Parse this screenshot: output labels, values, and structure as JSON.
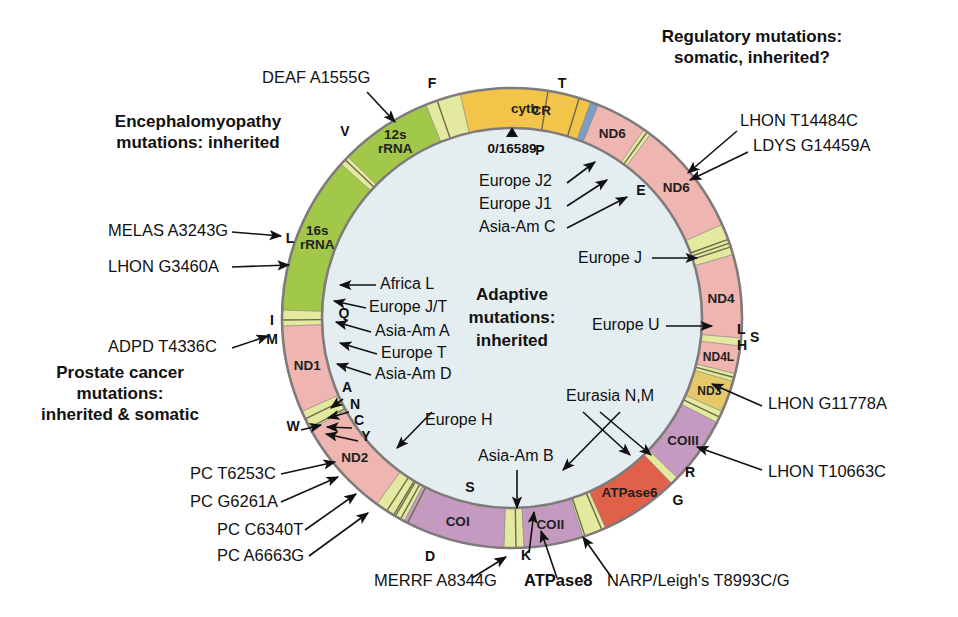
{
  "figure": {
    "center_label_lines": [
      "Adaptive",
      "mutations:",
      "inherited"
    ],
    "origin_label": "0/16589",
    "colors": {
      "control_region": "#7e9cc4",
      "rrna": "#a2c84a",
      "trna": "#e4e9a0",
      "nd_complex1": "#efb5b0",
      "cytb": "#f2c44a",
      "co_complex4": "#c49ac0",
      "atpase": "#e1604a",
      "ring_outline": "#807b7b",
      "interior": "#e4eef0"
    },
    "geometry": {
      "cx": 512,
      "cy": 318,
      "outer_r": 230,
      "inner_r": 190
    }
  },
  "headings": [
    {
      "id": "encephalomyopathy",
      "lines": [
        "Encephalomyopathy",
        "mutations: inherited"
      ],
      "x": 198,
      "y": 127
    },
    {
      "id": "regulatory",
      "lines": [
        "Regulatory mutations:",
        "somatic, inherited?"
      ],
      "x": 752,
      "y": 42
    },
    {
      "id": "prostate",
      "lines": [
        "Prostate cancer",
        "mutations:",
        "inherited & somatic"
      ],
      "x": 120,
      "y": 378
    }
  ],
  "center_text": {
    "lines": [
      "Adaptive",
      "mutations:",
      "inherited"
    ],
    "x": 512,
    "y": 300
  },
  "genes": [
    {
      "name": "CR",
      "start": 352.0,
      "end": 24.0,
      "color": "#7e9cc4",
      "label_r": 210,
      "cls": "gene"
    },
    {
      "name": "12s rRNA",
      "start": 314.5,
      "end": 338.0,
      "color": "#a2c84a",
      "label_r": 210,
      "cls": "gene",
      "two_line": true
    },
    {
      "name": "16s rRNA",
      "start": 272.0,
      "end": 312.0,
      "color": "#a2c84a",
      "label_r": 210,
      "cls": "gene",
      "two_line": true
    },
    {
      "name": "ND1",
      "start": 246.0,
      "end": 268.0,
      "color": "#efb5b0",
      "label_r": 210,
      "cls": "gene"
    },
    {
      "name": "ND2",
      "start": 216.0,
      "end": 241.0,
      "color": "#efb5b0",
      "label_r": 210,
      "cls": "gene"
    },
    {
      "name": "COI",
      "start": 182.0,
      "end": 208.0,
      "color": "#c49ac0",
      "label_r": 210,
      "cls": "gene"
    },
    {
      "name": "COII",
      "start": 162.0,
      "end": 177.0,
      "color": "#c49ac0",
      "label_r": 210,
      "cls": "gene"
    },
    {
      "name": "ATPase6",
      "start": 136.0,
      "end": 156.0,
      "color": "#e1604a",
      "label_r": 210,
      "cls": "gene"
    },
    {
      "name": "COIII",
      "start": 117.0,
      "end": 134.0,
      "color": "#c49ac0",
      "label_r": 210,
      "cls": "gene"
    },
    {
      "name": "ND3",
      "start": 106.0,
      "end": 114.0,
      "color": "#e4c86a",
      "label_r": 210,
      "cls": "gene-sm"
    },
    {
      "name": "ND4L",
      "start": 97.0,
      "end": 104.0,
      "color": "#efb5b0",
      "label_r": 210,
      "cls": "gene-sm"
    },
    {
      "name": "ND4",
      "start": 74.0,
      "end": 95.0,
      "color": "#efb5b0",
      "label_r": 210,
      "cls": "gene"
    },
    {
      "name": "ND6",
      "start": 37.0,
      "end": 66.0,
      "color": "#efb5b0",
      "label_r": 210,
      "cls": "gene"
    },
    {
      "name": "ND6",
      "start": 22.0,
      "end": 35.0,
      "color": "#efb5b0",
      "label_r": 210,
      "cls": "gene"
    },
    {
      "name": "cytb",
      "start": 347.0,
      "end": 20.0,
      "color": "#f2c44a",
      "label_r": 210,
      "cls": "gene",
      "sector": "right"
    }
  ],
  "trna_marks": [
    {
      "name": "F",
      "angle": 341.0,
      "label_r": 255
    },
    {
      "name": "V",
      "angle": 313.5,
      "label_r": 255
    },
    {
      "name": "L",
      "angle": 269.5,
      "label_r": 252
    },
    {
      "name": "I",
      "angle": 244.0,
      "label_r": 256
    },
    {
      "name": "M",
      "angle": 241.5,
      "label_r": 256
    },
    {
      "name": "W",
      "angle": 210.5,
      "label_r": 256
    },
    {
      "name": "A",
      "angle": 213.0,
      "label_r": 250
    },
    {
      "name": "N",
      "angle": 211.0,
      "label_r": 250
    },
    {
      "name": "C",
      "angle": 209.0,
      "label_r": 250
    },
    {
      "name": "Y",
      "angle": 207.0,
      "label_r": 250
    },
    {
      "name": "S",
      "angle": 179.0,
      "label_r": 255
    },
    {
      "name": "D",
      "angle": 161.5,
      "label_r": 255
    },
    {
      "name": "K",
      "angle": 157.0,
      "label_r": 255
    },
    {
      "name": "G",
      "angle": 115.5,
      "label_r": 255
    },
    {
      "name": "R",
      "angle": 105.0,
      "label_r": 255
    },
    {
      "name": "L",
      "angle": 72.0,
      "label_r": 254
    },
    {
      "name": "H",
      "angle": 70.0,
      "label_r": 254
    },
    {
      "name": "S",
      "angle": 71.0,
      "label_r": 254
    },
    {
      "name": "E",
      "angle": 36.0,
      "label_r": 254
    },
    {
      "name": "T",
      "angle": 17.0,
      "label_r": 255
    },
    {
      "name": "P",
      "angle": 9.0,
      "label_r": 255
    }
  ],
  "trna_visible_labels": [
    {
      "name": "F",
      "x": 432,
      "y": 88,
      "anchor": "middle"
    },
    {
      "name": "T",
      "x": 562,
      "y": 88,
      "anchor": "middle"
    },
    {
      "name": "V",
      "x": 345,
      "y": 136,
      "anchor": "middle"
    },
    {
      "name": "P",
      "x": 540,
      "y": 155,
      "anchor": "middle"
    },
    {
      "name": "E",
      "x": 641,
      "y": 195,
      "anchor": "middle"
    },
    {
      "name": "L",
      "x": 290,
      "y": 243,
      "anchor": "middle"
    },
    {
      "name": "Q",
      "x": 344,
      "y": 318,
      "anchor": "middle"
    },
    {
      "name": "I",
      "x": 272,
      "y": 325,
      "anchor": "middle"
    },
    {
      "name": "M",
      "x": 272,
      "y": 344,
      "anchor": "middle"
    },
    {
      "name": "L",
      "x": 737,
      "y": 334,
      "anchor": "start"
    },
    {
      "name": "S",
      "x": 750,
      "y": 342,
      "anchor": "start"
    },
    {
      "name": "H",
      "x": 737,
      "y": 350,
      "anchor": "start"
    },
    {
      "name": "A",
      "x": 347,
      "y": 392,
      "anchor": "middle"
    },
    {
      "name": "N",
      "x": 355,
      "y": 409,
      "anchor": "middle"
    },
    {
      "name": "C",
      "x": 359,
      "y": 425,
      "anchor": "middle"
    },
    {
      "name": "Y",
      "x": 366,
      "y": 441,
      "anchor": "middle"
    },
    {
      "name": "W",
      "x": 293,
      "y": 431,
      "anchor": "middle"
    },
    {
      "name": "R",
      "x": 690,
      "y": 477,
      "anchor": "middle"
    },
    {
      "name": "G",
      "x": 678,
      "y": 505,
      "anchor": "middle"
    },
    {
      "name": "S",
      "x": 470,
      "y": 492,
      "anchor": "middle"
    },
    {
      "name": "D",
      "x": 430,
      "y": 561,
      "anchor": "middle"
    },
    {
      "name": "K",
      "x": 526,
      "y": 560,
      "anchor": "middle"
    }
  ],
  "disease_annotations": [
    {
      "id": "deaf",
      "text": "DEAF A1555G",
      "x": 262,
      "y": 83,
      "anchor": "start"
    },
    {
      "id": "lhon-t14484c",
      "text": "LHON T14484C",
      "x": 740,
      "y": 126,
      "anchor": "start"
    },
    {
      "id": "ldys",
      "text": "LDYS G14459A",
      "x": 753,
      "y": 151,
      "anchor": "start"
    },
    {
      "id": "melas",
      "text": "MELAS A3243G",
      "x": 108,
      "y": 236,
      "anchor": "start"
    },
    {
      "id": "lhon-g3460a",
      "text": "LHON G3460A",
      "x": 108,
      "y": 272,
      "anchor": "start"
    },
    {
      "id": "adpd",
      "text": "ADPD T4336C",
      "x": 108,
      "y": 352,
      "anchor": "start"
    },
    {
      "id": "lhon-g11778a",
      "text": "LHON G11778A",
      "x": 768,
      "y": 409,
      "anchor": "start"
    },
    {
      "id": "lhon-t10663c",
      "text": "LHON T10663C",
      "x": 768,
      "y": 477,
      "anchor": "start"
    },
    {
      "id": "pc-t6253c",
      "text": "PC T6253C",
      "x": 190,
      "y": 479,
      "anchor": "start"
    },
    {
      "id": "pc-g6261a",
      "text": "PC G6261A",
      "x": 190,
      "y": 507,
      "anchor": "start"
    },
    {
      "id": "pc-c6340t",
      "text": "PC C6340T",
      "x": 217,
      "y": 535,
      "anchor": "start"
    },
    {
      "id": "pc-a6663g",
      "text": "PC A6663G",
      "x": 217,
      "y": 561,
      "anchor": "start"
    },
    {
      "id": "merrf",
      "text": "MERRF A8344G",
      "x": 374,
      "y": 586,
      "anchor": "start"
    },
    {
      "id": "atpase8",
      "text": "ATPase8",
      "x": 524,
      "y": 586,
      "anchor": "start",
      "bold": true
    },
    {
      "id": "narp",
      "text": "NARP/Leigh's T8993C/G",
      "x": 607,
      "y": 586,
      "anchor": "start"
    }
  ],
  "haplogroup_annotations": [
    {
      "id": "europe-j2",
      "text": "Europe J2",
      "x": 479,
      "y": 186,
      "anchor": "start"
    },
    {
      "id": "europe-j1",
      "text": "Europe J1",
      "x": 479,
      "y": 209,
      "anchor": "start"
    },
    {
      "id": "asia-am-c",
      "text": "Asia-Am C",
      "x": 479,
      "y": 232,
      "anchor": "start"
    },
    {
      "id": "europe-j",
      "text": "Europe J",
      "x": 578,
      "y": 263,
      "anchor": "start"
    },
    {
      "id": "europe-u",
      "text": "Europe U",
      "x": 592,
      "y": 330,
      "anchor": "start"
    },
    {
      "id": "africa-l",
      "text": "Africa L",
      "x": 380,
      "y": 289,
      "anchor": "start"
    },
    {
      "id": "europe-jt",
      "text": "Europe J/T",
      "x": 369,
      "y": 312,
      "anchor": "start"
    },
    {
      "id": "asia-am-a",
      "text": "Asia-Am A",
      "x": 375,
      "y": 336,
      "anchor": "start"
    },
    {
      "id": "europe-t",
      "text": "Europe T",
      "x": 381,
      "y": 358,
      "anchor": "start"
    },
    {
      "id": "asia-am-d",
      "text": "Asia-Am D",
      "x": 375,
      "y": 379,
      "anchor": "start"
    },
    {
      "id": "europe-h",
      "text": "Europe H",
      "x": 425,
      "y": 425,
      "anchor": "start"
    },
    {
      "id": "asia-am-b",
      "text": "Asia-Am B",
      "x": 478,
      "y": 461,
      "anchor": "start"
    },
    {
      "id": "eurasia-nm",
      "text": "Eurasia N,M",
      "x": 566,
      "y": 401,
      "anchor": "start"
    }
  ],
  "leader_lines": [
    {
      "id": "deaf-lead",
      "d": "M 367 92 L 395 122"
    },
    {
      "id": "lhon-t14484c-lead",
      "d": "M 737 131 L 688 173"
    },
    {
      "id": "ldys-lead",
      "d": "M 748 152 L 690 180"
    },
    {
      "id": "melas-lead",
      "d": "M 232 232 L 281 236"
    },
    {
      "id": "lhon-g3460a-lead",
      "d": "M 232 267 L 289 265"
    },
    {
      "id": "adpd-lead",
      "d": "M 232 348 L 268 336"
    },
    {
      "id": "lhon-g11778a-lead",
      "d": "M 762 406 L 712 384"
    },
    {
      "id": "lhon-t10663c-lead",
      "d": "M 762 470 L 697 447"
    },
    {
      "id": "pc-t6253c-lead",
      "d": "M 281 474 L 335 462"
    },
    {
      "id": "pc-g6261a-lead",
      "d": "M 281 502 L 338 477"
    },
    {
      "id": "pc-c6340t-lead",
      "d": "M 305 530 L 356 494"
    },
    {
      "id": "pc-a6663g-lead",
      "d": "M 309 556 L 368 513"
    },
    {
      "id": "merrf-lead",
      "d": "M 472 578 L 506 557"
    },
    {
      "id": "atpase8-lead",
      "d": "M 557 578 L 541 531"
    },
    {
      "id": "narp-lead",
      "d": "M 612 578 L 583 537"
    },
    {
      "id": "europe-j2-lead",
      "d": "M 567 183 L 595 162"
    },
    {
      "id": "europe-j1-lead",
      "d": "M 567 206 L 607 180"
    },
    {
      "id": "asia-am-c-lead",
      "d": "M 567 228 L 627 197"
    },
    {
      "id": "europe-j-lead",
      "d": "M 652 258 L 697 258"
    },
    {
      "id": "europe-u-lead",
      "d": "M 666 326 L 712 326"
    },
    {
      "id": "africa-l-lead",
      "d": "M 376 285 L 340 285"
    },
    {
      "id": "europe-jt-lead",
      "d": "M 366 308 L 334 301"
    },
    {
      "id": "asia-am-a-lead",
      "d": "M 371 332 L 336 322"
    },
    {
      "id": "europe-t-lead",
      "d": "M 377 354 L 340 343"
    },
    {
      "id": "asia-am-d-lead",
      "d": "M 371 375 L 337 364"
    },
    {
      "id": "europe-h-lead",
      "d": "M 432 412 L 397 448"
    },
    {
      "id": "asia-am-b-lead",
      "d": "M 517 470 L 517 508"
    },
    {
      "id": "eurasia-nm-1",
      "d": "M 600 412 L 651 455"
    },
    {
      "id": "eurasia-nm-2",
      "d": "M 583 412 L 630 455"
    },
    {
      "id": "eurasia-nm-3",
      "d": "M 620 412 L 563 470"
    },
    {
      "id": "trna-a-lead",
      "d": "M 343 399 L 331 408"
    },
    {
      "id": "trna-n-lead",
      "d": "M 349 412 L 328 418"
    },
    {
      "id": "trna-c-lead",
      "d": "M 352 428 L 327 427"
    },
    {
      "id": "trna-y-lead",
      "d": "M 358 441 L 326 434"
    },
    {
      "id": "trna-w-lead",
      "d": "M 301 430 L 321 425"
    },
    {
      "id": "trna-k-lead",
      "d": "M 529 553 L 534 512"
    }
  ]
}
